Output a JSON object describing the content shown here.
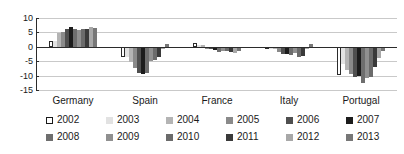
{
  "chart_data": {
    "type": "bar",
    "title": "",
    "subtitle": "",
    "xlabel": "",
    "ylabel": "",
    "ylim": [
      -15,
      10
    ],
    "yticks": [
      10,
      5,
      0,
      -5,
      -10,
      -15
    ],
    "ytick_labels": [
      "10",
      "5",
      "0",
      "-5",
      "-10",
      "-15"
    ],
    "grid": true,
    "legend_position": "bottom",
    "categories": [
      "Germany",
      "Spain",
      "France",
      "Italy",
      "Portugal"
    ],
    "series": [
      {
        "name": "2002",
        "values": [
          2.0,
          -3.7,
          1.2,
          -0.3,
          -9.9
        ]
      },
      {
        "name": "2003",
        "values": [
          1.9,
          -3.5,
          0.7,
          -0.8,
          -6.0
        ]
      },
      {
        "name": "2004",
        "values": [
          4.7,
          -5.2,
          0.5,
          -0.9,
          -8.1
        ]
      },
      {
        "name": "2005",
        "values": [
          5.1,
          -7.4,
          -0.5,
          -1.7,
          -9.5
        ]
      },
      {
        "name": "2006",
        "values": [
          6.3,
          -9.0,
          -0.6,
          -2.6,
          -10.4
        ]
      },
      {
        "name": "2007",
        "values": [
          6.8,
          -9.6,
          -1.0,
          -2.4,
          -10.1
        ]
      },
      {
        "name": "2008",
        "values": [
          6.2,
          -9.2,
          -1.7,
          -2.9,
          -12.6
        ]
      },
      {
        "name": "2009",
        "values": [
          5.9,
          -4.8,
          -1.3,
          -2.0,
          -10.9
        ]
      },
      {
        "name": "2010",
        "values": [
          6.3,
          -4.5,
          -1.6,
          -3.5,
          -10.6
        ]
      },
      {
        "name": "2011",
        "values": [
          6.2,
          -3.7,
          -1.9,
          -3.1,
          -7.0
        ]
      },
      {
        "name": "2012",
        "values": [
          6.8,
          -0.8,
          -2.3,
          -0.4,
          -4.0
        ]
      },
      {
        "name": "2013",
        "values": [
          6.5,
          0.8,
          -1.5,
          0.9,
          -1.5
        ]
      }
    ]
  },
  "legend": {
    "rows": [
      [
        {
          "label": "2002",
          "color": "#ffffff"
        },
        {
          "label": "2003",
          "color": "#e2e2e2"
        },
        {
          "label": "2004",
          "color": "#b4b4b4"
        },
        {
          "label": "2005",
          "color": "#8a8a8a"
        },
        {
          "label": "2006",
          "color": "#4f4f4f"
        },
        {
          "label": "2007",
          "color": "#1c1c1c"
        }
      ],
      [
        {
          "label": "2008",
          "color": "#6e6e6e"
        },
        {
          "label": "2009",
          "color": "#909090"
        },
        {
          "label": "2010",
          "color": "#6b6b6b"
        },
        {
          "label": "2011",
          "color": "#3a3a3a"
        },
        {
          "label": "2012",
          "color": "#a8a8a8"
        },
        {
          "label": "2013",
          "color": "#777777"
        }
      ]
    ]
  },
  "colors": {
    "axis": "#2b2b2b",
    "grid": "#c9c9c9",
    "background": "#ffffff",
    "text": "#1a1a1a"
  }
}
